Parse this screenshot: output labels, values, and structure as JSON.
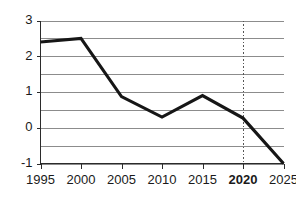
{
  "chart_data": {
    "type": "line",
    "title": "",
    "xlabel": "",
    "ylabel": "",
    "x": [
      1995,
      2000,
      2005,
      2010,
      2015,
      2020,
      2025
    ],
    "values": [
      2.4,
      2.5,
      0.87,
      0.3,
      0.9,
      0.27,
      -1.0
    ],
    "series": [
      {
        "name": "",
        "values": [
          2.4,
          2.5,
          0.87,
          0.3,
          0.9,
          0.27,
          -1.0
        ]
      }
    ],
    "xlim": [
      1995,
      2025
    ],
    "ylim": [
      -1,
      3
    ],
    "xticks": [
      1995,
      2000,
      2005,
      2010,
      2015,
      2020,
      2025
    ],
    "xtick_labels": [
      "1995",
      "2000",
      "2005",
      "2010",
      "2015",
      "2020",
      "2025"
    ],
    "xtick_bold": [
      false,
      false,
      false,
      false,
      false,
      true,
      false
    ],
    "yticks": [
      -1,
      0,
      1,
      2,
      3
    ],
    "ytick_labels": [
      "-1",
      "0",
      "1",
      "2",
      "3"
    ],
    "gridlines_y": [
      -1,
      -0.5,
      0,
      0.5,
      1,
      1.5,
      2,
      2.5,
      3
    ],
    "grid": true,
    "legend": "none",
    "annotations": [
      {
        "name": "vertical-marker-2020",
        "type": "vline",
        "x": 2020,
        "style": "dotted",
        "label": "2020"
      }
    ],
    "colors": {
      "series_line": "#161616",
      "gridline": "#8c8c8c",
      "axis": "#2b2b2b",
      "marker": "#555555",
      "background": "#ffffff",
      "text": "#1a1a1a"
    }
  }
}
